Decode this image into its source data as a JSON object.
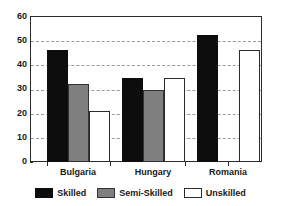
{
  "chart_data": {
    "type": "bar",
    "title": "",
    "subtitle": "",
    "xlabel": "",
    "ylabel": "",
    "categories": [
      "Bulgaria",
      "Hungary",
      "Romania"
    ],
    "series": [
      {
        "name": "Skilled",
        "color": "#0d0d0d",
        "values": [
          46,
          34.5,
          52
        ]
      },
      {
        "name": "Semi-Skilled",
        "color": "#7f7f7f",
        "values": [
          32,
          29.5,
          0
        ]
      },
      {
        "name": "Unskilled",
        "color": "#ffffff",
        "values": [
          21,
          34.5,
          46
        ]
      }
    ],
    "ylim": [
      0,
      60
    ],
    "yticks": [
      0,
      10,
      20,
      30,
      40,
      50,
      60
    ],
    "ytick_labels": [
      "0",
      "10",
      "20",
      "30",
      "40",
      "50",
      "60"
    ],
    "grid": true,
    "grid_axis": "y",
    "grid_style": "dashed",
    "grid_color": "#9a9a9a",
    "legend_position": "bottom",
    "frame_color": "#2b2b2b",
    "background": "#ffffff"
  },
  "axes": {
    "y_tick_labels": [
      "60",
      "50",
      "40",
      "30",
      "20",
      "10",
      "0"
    ],
    "x_tick_labels": [
      "Bulgaria",
      "Hungary",
      "Romania"
    ]
  },
  "legend": {
    "items": [
      {
        "label": "Skilled",
        "color": "#0d0d0d"
      },
      {
        "label": "Semi-Skilled",
        "color": "#7f7f7f"
      },
      {
        "label": "Unskilled",
        "color": "#ffffff"
      }
    ]
  }
}
